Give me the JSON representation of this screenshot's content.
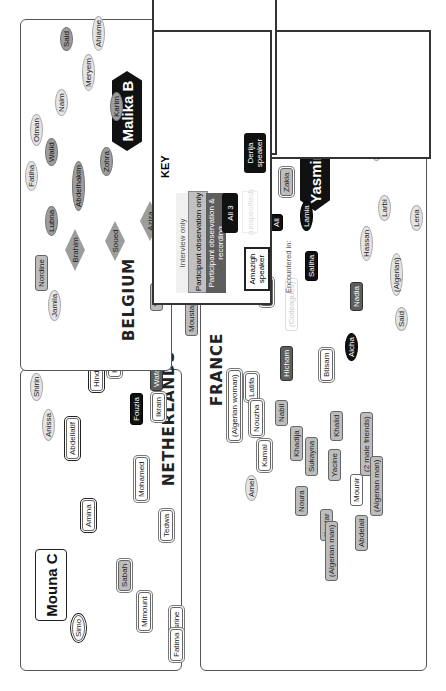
{
  "key": {
    "title": "KEY",
    "participation": [
      "Interview only",
      "Participant observation only",
      "Participant observation & recording",
      "All 3"
    ],
    "speakers": {
      "amazigh": "Amazigh speaker",
      "derija": "Derija speaker",
      "unspecified": "(unspecified)"
    },
    "encountered_label": "Encountered in:",
    "encountered": [
      "EU",
      "AA",
      "Both"
    ],
    "relations": [
      "Friend",
      "Sibling",
      "Cousin",
      "Married",
      "Child",
      "Young children"
    ],
    "young_children_box": "(x1)"
  },
  "panels": {
    "belgium": {
      "label": "BELGIUM",
      "ego": "Malika B",
      "nodes": [
        "Said",
        "Ahlame",
        "Meryem",
        "Naim",
        "Otman",
        "Walid",
        "Fatiha",
        "Abdelhakim",
        "Karim",
        "Zohra",
        "Lubna",
        "Brahim",
        "Soued",
        "Aziza",
        "Nordine",
        "Jamila",
        "Saida",
        "Ria",
        "Sanae",
        "Yunis",
        "(Algerian woman)",
        "Naima",
        "Moustapha",
        "Hamid"
      ]
    },
    "netherlands": {
      "label": "NETHERLANDS",
      "ego": "Mouna C",
      "nodes": [
        "Shirin",
        "Anissa",
        "Abdellatif",
        "Amina",
        "Hind",
        "Mimoun",
        "Hanane",
        "Wafae",
        "Fouzia",
        "Ikram",
        "Mohamed",
        "Tedwa",
        "Sabah",
        "Mimount",
        "Nasrine",
        "Fatima",
        "Simo",
        "(Siblings)",
        "(husband)"
      ]
    },
    "france": {
      "label": "FRANCE",
      "ego": "Yasmine A",
      "nodes": [
        "Najat",
        "Chaima",
        "Slima",
        "Karima",
        "Michel",
        "Ahmed",
        "(Algerian)",
        "Rachid",
        "Zakia",
        "Loulia",
        "Larbi",
        "Lena",
        "Lamia",
        "Ali",
        "Rabia",
        "Saliha",
        "Hassan",
        "(Algerian)",
        "Nadia",
        "Abdel",
        "(Colleagues)",
        "Said",
        "Aicha",
        "Latifa",
        "Hicham",
        "Btisam",
        "(Algerian woman)",
        "Nouzha",
        "Nabil",
        "Kamal",
        "Khadija",
        "Sukayna",
        "Khalid",
        "Yacine",
        "Mounir",
        "(2 male friends)",
        "Noura",
        "Kaotar",
        "Abdelali",
        "(Algerian man)",
        "(Algerian man)",
        "Amel"
      ]
    }
  },
  "colors": {
    "black": "#111111",
    "dark": "#5e5e5e",
    "mid": "#9d9d9d",
    "light": "#e4e4e4",
    "border": "#555555"
  }
}
